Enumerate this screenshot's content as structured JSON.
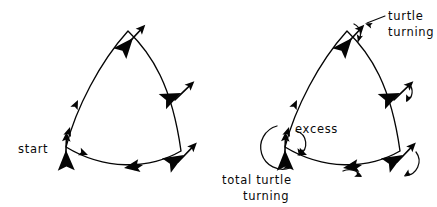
{
  "figure": {
    "canvas": {
      "width": 437,
      "height": 207
    },
    "background_color": "#ffffff",
    "ink_color": "#050505"
  },
  "labels": {
    "start": "start",
    "turtle_turning_line1": "turtle",
    "turtle_turning_line2": "turning",
    "excess": "excess",
    "total_turtle_turning_line1": "total turtle",
    "total_turtle_turning_line2": "turning"
  },
  "panels": [
    {
      "id": "left-panel",
      "name": "plain-path",
      "origin": [
        0,
        0
      ],
      "annotations": [
        "start"
      ],
      "turtle_count": 3,
      "direction_arrow_count": 4
    },
    {
      "id": "right-panel",
      "name": "annotated-path",
      "origin": [
        219,
        0
      ],
      "annotations": [
        "turtle turning",
        "excess",
        "total turtle turning"
      ],
      "turtle_count": 3,
      "direction_arrow_count": 4,
      "turn_arc_count": 4
    }
  ],
  "path_geometry": {
    "description": "curved triangle (Reuleaux-like) traversed counter-clockwise",
    "vertices": [
      {
        "name": "top",
        "point": [
          128,
          31
        ]
      },
      {
        "name": "right",
        "point": [
          180,
          150
        ]
      },
      {
        "name": "bottom-left",
        "point": [
          67,
          146
        ]
      }
    ]
  },
  "turtles": [
    {
      "panel": "left",
      "vertex": "top",
      "position": [
        125,
        33
      ],
      "heading_deg": -40
    },
    {
      "panel": "left",
      "vertex": "right",
      "position": [
        174,
        88
      ],
      "heading_deg": -35
    },
    {
      "panel": "left",
      "vertex": "bottom-left",
      "position": [
        66,
        146
      ],
      "heading_deg": -90
    },
    {
      "panel": "left",
      "vertex": "bottom-right",
      "position": [
        176,
        150
      ],
      "heading_deg": -35
    },
    {
      "panel": "right",
      "vertex": "top",
      "position": [
        344,
        33
      ],
      "heading_deg": -40
    },
    {
      "panel": "right",
      "vertex": "right",
      "position": [
        393,
        88
      ],
      "heading_deg": -35
    },
    {
      "panel": "right",
      "vertex": "bottom-left",
      "position": [
        285,
        146
      ],
      "heading_deg": -90
    },
    {
      "panel": "right",
      "vertex": "bottom-right",
      "position": [
        395,
        150
      ],
      "heading_deg": -35
    }
  ]
}
